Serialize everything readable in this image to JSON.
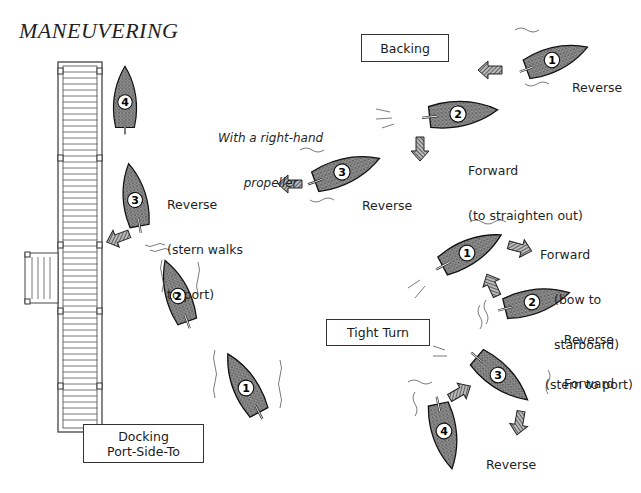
{
  "title": "MANEUVERING",
  "note": {
    "line1": "With a right-hand",
    "line2": "propeller"
  },
  "sections": {
    "backing": {
      "box_label": "Backing",
      "steps": [
        {
          "number": "1",
          "action": "Reverse",
          "detail": ""
        },
        {
          "number": "2",
          "action": "Forward",
          "detail": "(to straighten out)"
        },
        {
          "number": "3",
          "action": "Reverse",
          "detail": ""
        }
      ]
    },
    "tight_turn": {
      "box_label": "Tight Turn",
      "steps": [
        {
          "number": "1",
          "action": "Forward",
          "detail_line1": "(bow to",
          "detail_line2": "starboard)"
        },
        {
          "number": "2",
          "action": "Reverse",
          "detail_line1": "(stern to port)",
          "detail_line2": ""
        },
        {
          "number": "3",
          "action": "Forward",
          "detail_line1": "",
          "detail_line2": ""
        },
        {
          "number": "4",
          "action": "Reverse",
          "detail_line1": "",
          "detail_line2": ""
        }
      ]
    },
    "docking": {
      "box_line1": "Docking",
      "box_line2": "Port-Side-To",
      "steps": [
        {
          "number": "1",
          "action": ""
        },
        {
          "number": "2",
          "action": ""
        },
        {
          "number": "3",
          "action": "Reverse",
          "detail_line1": "(stern walks",
          "detail_line2": "to port)"
        },
        {
          "number": "4",
          "action": ""
        }
      ]
    }
  },
  "colors": {
    "hull_fill": "#6e6e6e",
    "ink": "#1a1a1a",
    "dock_line": "#444444",
    "background": "#ffffff"
  }
}
